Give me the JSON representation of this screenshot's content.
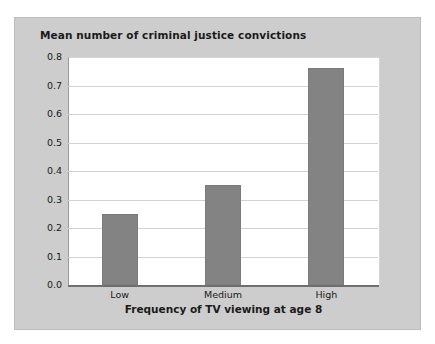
{
  "chart_data": {
    "type": "bar",
    "title": "Mean number of criminal justice convictions",
    "xlabel": "Frequency of TV viewing at age 8",
    "ylabel": "",
    "categories": [
      "Low",
      "Medium",
      "High"
    ],
    "values": [
      0.25,
      0.35,
      0.76
    ],
    "ylim": [
      0.0,
      0.8
    ],
    "ytick_labels": [
      "0.0",
      "0.1",
      "0.2",
      "0.3",
      "0.4",
      "0.5",
      "0.6",
      "0.7",
      "0.8"
    ],
    "ytick_values": [
      0.0,
      0.1,
      0.2,
      0.3,
      0.4,
      0.5,
      0.6,
      0.7,
      0.8
    ],
    "grid": true,
    "legend": null,
    "bar_color": "#838383",
    "panel_color": "#cdcdcd",
    "plot_background": "#ffffff",
    "gridline_color": "#d2d2d2",
    "axis_color": "#6f6f6f",
    "text_color": "#1a1a1a"
  }
}
